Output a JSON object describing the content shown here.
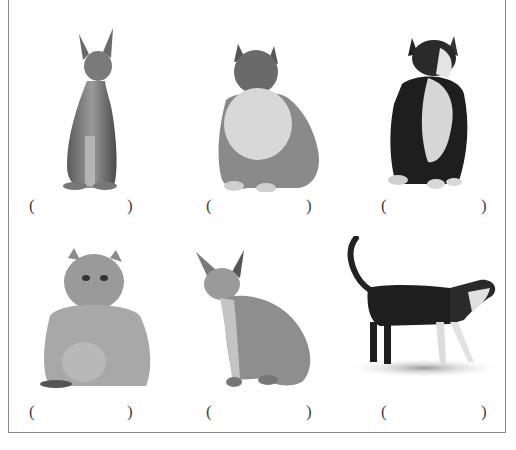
{
  "worksheet": {
    "items": [
      {
        "subject": "hairless sphynx cat sitting upright",
        "open": "(",
        "close": ")"
      },
      {
        "subject": "fluffy long-haired grey and white cat sitting",
        "open": "(",
        "close": ")"
      },
      {
        "subject": "black and white long-haired cat looking up",
        "open": "(",
        "close": ")"
      },
      {
        "subject": "flat-faced persian cat sitting",
        "open": "(",
        "close": ")"
      },
      {
        "subject": "hairless sphynx cat sitting sideways",
        "open": "(",
        "close": ")"
      },
      {
        "subject": "black and white short-haired cat walking",
        "open": "(",
        "close": ")"
      }
    ]
  }
}
